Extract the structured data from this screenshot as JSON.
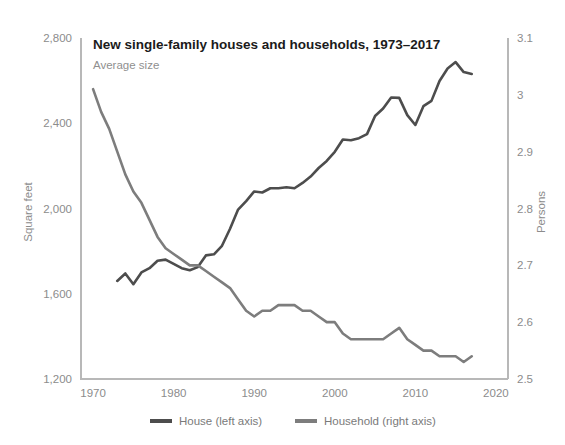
{
  "chart_data": {
    "type": "line",
    "title": "New single-family houses and households, 1973–2017",
    "subtitle": "Average size",
    "xlabel": "",
    "ylabel": "Square feet",
    "y2label": "Persons",
    "xlim": [
      1968.5,
      2021.5
    ],
    "ylim": [
      1200,
      2800
    ],
    "y2lim": [
      2.5,
      3.1
    ],
    "grid": false,
    "legend_position": "bottom",
    "xticks": [
      1970,
      1980,
      1990,
      2000,
      2010,
      2020
    ],
    "xticklabels": [
      "1970",
      "1980",
      "1990",
      "2000",
      "2010",
      "2020"
    ],
    "yticks": [
      1200,
      1600,
      2000,
      2400,
      2800
    ],
    "yticklabels": [
      "1,200",
      "1,600",
      "2,000",
      "2,400",
      "2,800"
    ],
    "y2ticks": [
      2.5,
      2.6,
      2.7,
      2.8,
      2.9,
      3.0,
      3.1
    ],
    "y2ticklabels": [
      "2.5",
      "2.6",
      "2.7",
      "2.8",
      "2.9",
      "3",
      "3.1"
    ],
    "series": [
      {
        "name": "House (left axis)",
        "axis": "left",
        "color": "#4d4d4d",
        "unit": "square feet",
        "x": [
          1973,
          1974,
          1975,
          1976,
          1977,
          1978,
          1979,
          1980,
          1981,
          1982,
          1983,
          1984,
          1985,
          1986,
          1987,
          1988,
          1989,
          1990,
          1991,
          1992,
          1993,
          1994,
          1995,
          1996,
          1997,
          1998,
          1999,
          2000,
          2001,
          2002,
          2003,
          2004,
          2005,
          2006,
          2007,
          2008,
          2009,
          2010,
          2011,
          2012,
          2013,
          2014,
          2015,
          2016,
          2017
        ],
        "values": [
          1660,
          1695,
          1645,
          1700,
          1720,
          1755,
          1760,
          1740,
          1720,
          1710,
          1725,
          1780,
          1785,
          1825,
          1905,
          1995,
          2035,
          2080,
          2075,
          2095,
          2095,
          2100,
          2095,
          2120,
          2150,
          2190,
          2223,
          2266,
          2324,
          2320,
          2330,
          2349,
          2434,
          2469,
          2521,
          2519,
          2438,
          2392,
          2480,
          2505,
          2598,
          2657,
          2687,
          2640,
          2631
        ]
      },
      {
        "name": "Household (right axis)",
        "axis": "right",
        "color": "#7d7d7d",
        "unit": "persons",
        "x": [
          1970,
          1971,
          1972,
          1973,
          1974,
          1975,
          1976,
          1977,
          1978,
          1979,
          1980,
          1981,
          1982,
          1983,
          1984,
          1985,
          1986,
          1987,
          1988,
          1989,
          1990,
          1991,
          1992,
          1993,
          1994,
          1995,
          1996,
          1997,
          1998,
          1999,
          2000,
          2001,
          2002,
          2003,
          2004,
          2005,
          2006,
          2007,
          2008,
          2009,
          2010,
          2011,
          2012,
          2013,
          2014,
          2015,
          2016,
          2017
        ],
        "values": [
          3.01,
          2.97,
          2.94,
          2.9,
          2.86,
          2.83,
          2.81,
          2.78,
          2.75,
          2.73,
          2.72,
          2.71,
          2.7,
          2.7,
          2.69,
          2.68,
          2.67,
          2.66,
          2.64,
          2.62,
          2.61,
          2.62,
          2.62,
          2.63,
          2.63,
          2.63,
          2.62,
          2.62,
          2.61,
          2.6,
          2.6,
          2.58,
          2.57,
          2.57,
          2.57,
          2.57,
          2.57,
          2.58,
          2.59,
          2.57,
          2.56,
          2.55,
          2.55,
          2.54,
          2.54,
          2.54,
          2.53,
          2.54
        ]
      }
    ]
  },
  "legend": {
    "items": [
      {
        "label": "House (left axis)",
        "color": "#4d4d4d"
      },
      {
        "label": "Household (right axis)",
        "color": "#7d7d7d"
      }
    ]
  },
  "colors": {
    "house": "#4d4d4d",
    "household": "#7d7d7d",
    "axis": "#b8b8b8",
    "tick_text": "#8c8c8c",
    "title_text": "#1b1b1b",
    "subtitle_text": "#8f8f8f",
    "background": "#ffffff"
  }
}
